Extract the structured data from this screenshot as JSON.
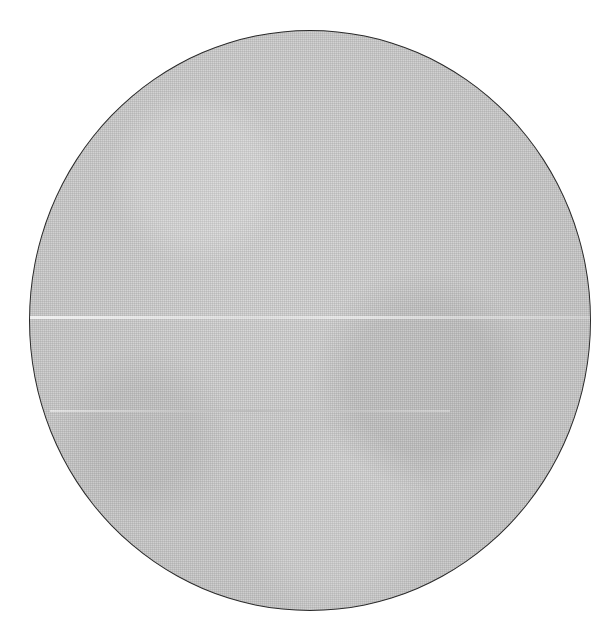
{
  "image": {
    "subject": "gray halftone-textured circular disc",
    "shape": "circle",
    "outline_color": "#2a2a2a",
    "fill_color": "#d6d6d6",
    "background_color": "#ffffff",
    "features": [
      "faint horizontal light streak across middle",
      "faint lower horizontal streak"
    ]
  }
}
